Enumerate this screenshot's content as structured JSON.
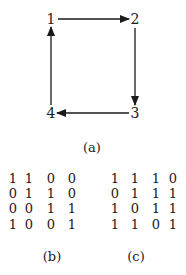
{
  "figure_a": {
    "caption": "(a)",
    "nodes": [
      {
        "label": "1",
        "x": 51,
        "y": 19
      },
      {
        "label": "2",
        "x": 135,
        "y": 19
      },
      {
        "label": "3",
        "x": 135,
        "y": 113
      },
      {
        "label": "4",
        "x": 51,
        "y": 113
      }
    ],
    "edges": [
      {
        "from": "1",
        "to": "2"
      },
      {
        "from": "2",
        "to": "3"
      },
      {
        "from": "3",
        "to": "4"
      },
      {
        "from": "4",
        "to": "1"
      }
    ]
  },
  "figure_b": {
    "caption": "(b)",
    "matrix": [
      [
        "1",
        "1",
        "0",
        "0"
      ],
      [
        "0",
        "1",
        "1",
        "0"
      ],
      [
        "0",
        "0",
        "1",
        "1"
      ],
      [
        "1",
        "0",
        "0",
        "1"
      ]
    ]
  },
  "figure_c": {
    "caption": "(c)",
    "matrix": [
      [
        "1",
        "1",
        "1",
        "0"
      ],
      [
        "0",
        "1",
        "1",
        "1"
      ],
      [
        "1",
        "0",
        "1",
        "1"
      ],
      [
        "1",
        "1",
        "0",
        "1"
      ]
    ]
  }
}
